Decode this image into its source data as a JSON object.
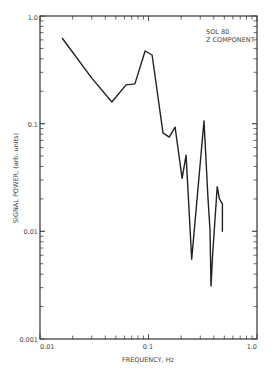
{
  "chart_data": {
    "type": "line",
    "title": "",
    "annotation": [
      "SOL 80",
      "Z COMPONENT"
    ],
    "xlabel": "FREQUENCY, Hz",
    "ylabel": "SIGNAL POWER, (arb. units)",
    "xscale": "log",
    "yscale": "log",
    "xlim": [
      0.01,
      1.0
    ],
    "ylim": [
      0.001,
      1.0
    ],
    "x_ticks": [
      "0.01",
      "0.1",
      "1.0"
    ],
    "y_ticks": [
      "0.001",
      "0.01",
      "0.1",
      "1.0"
    ],
    "grid": false,
    "legend": null,
    "series": [
      {
        "name": "SOL 80 Z component",
        "x": [
          0.016,
          0.03,
          0.046,
          0.062,
          0.075,
          0.093,
          0.108,
          0.136,
          0.155,
          0.176,
          0.204,
          0.222,
          0.25,
          0.325,
          0.353,
          0.369,
          0.377,
          0.39,
          0.43,
          0.45,
          0.48,
          0.48
        ],
        "y": [
          0.625,
          0.265,
          0.159,
          0.229,
          0.234,
          0.473,
          0.434,
          0.082,
          0.075,
          0.093,
          0.031,
          0.051,
          0.0055,
          0.106,
          0.021,
          0.0103,
          0.0031,
          0.006,
          0.026,
          0.02,
          0.018,
          0.0099
        ]
      }
    ]
  },
  "labels": {
    "annotation_line1": "SOL 80",
    "annotation_line2": "Z COMPONENT",
    "xlabel": "FREQUENCY, Hz",
    "ylabel": "SIGNAL POWER, (arb. units)",
    "xtick_0": "0.01",
    "xtick_1": "0.1",
    "xtick_2": "1.0",
    "ytick_0": "0.001",
    "ytick_1": "0.01",
    "ytick_2": "0.1",
    "ytick_3": "1.0"
  }
}
